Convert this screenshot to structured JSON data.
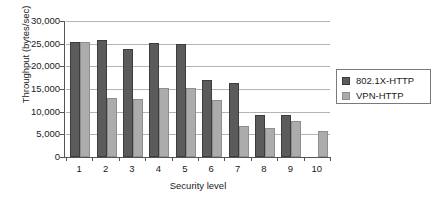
{
  "chart_data": {
    "type": "bar",
    "title": "",
    "xlabel": "Security level",
    "ylabel": "Throughput (bytes/sec)",
    "categories": [
      "1",
      "2",
      "3",
      "4",
      "5",
      "6",
      "7",
      "8",
      "9",
      "10"
    ],
    "series": [
      {
        "name": "802.1X-HTTP",
        "color": "#5b5b5b",
        "values": [
          25400,
          25800,
          23900,
          25100,
          25000,
          17000,
          16300,
          9300,
          9200,
          null
        ]
      },
      {
        "name": "VPN-HTTP",
        "color": "#acacac",
        "values": [
          25400,
          13000,
          12700,
          15300,
          15300,
          12600,
          6800,
          6400,
          8000,
          5700
        ]
      }
    ],
    "ylim": [
      0,
      30000
    ],
    "ytick_labels": [
      "30,000",
      "25,000",
      "20,000",
      "15,000",
      "10,000",
      "5,000",
      "0"
    ],
    "ytick_values": [
      30000,
      25000,
      20000,
      15000,
      10000,
      5000,
      0
    ],
    "grid": true,
    "grid_axis": "y",
    "legend_position": "right"
  },
  "legend": {
    "entries": [
      {
        "label": "802.1X-HTTP"
      },
      {
        "label": "VPN-HTTP"
      }
    ]
  }
}
